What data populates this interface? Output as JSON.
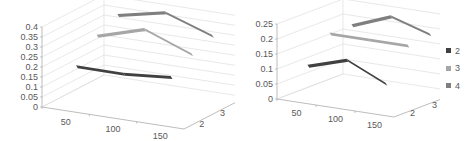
{
  "chart_data": [
    {
      "type": "line",
      "subtype": "3d-line",
      "title": "",
      "xlabel": "",
      "ylabel": "",
      "x": [
        50,
        100,
        150
      ],
      "x_tick_labels": [
        "50",
        "100",
        "150"
      ],
      "depth_tick_labels": [
        "2",
        "3",
        "4"
      ],
      "y_tick_labels": [
        "0",
        "0.05",
        "0.1",
        "0.15",
        "0.2",
        "0.25",
        "0.3",
        "0.35",
        "0.4"
      ],
      "ylim": [
        0,
        0.4
      ],
      "grid": true,
      "series": [
        {
          "name": "2",
          "color": "#404040",
          "values": [
            0.2,
            0.2,
            0.22
          ]
        },
        {
          "name": "3",
          "color": "#a6a6a6",
          "values": [
            0.3,
            0.37,
            0.28
          ]
        },
        {
          "name": "4",
          "color": "#7f7f7f",
          "values": [
            0.35,
            0.4,
            0.32
          ]
        }
      ]
    },
    {
      "type": "line",
      "subtype": "3d-line",
      "title": "",
      "xlabel": "",
      "ylabel": "",
      "x": [
        50,
        100,
        150
      ],
      "x_tick_labels": [
        "50",
        "100",
        "150"
      ],
      "depth_tick_labels": [
        "2",
        "3",
        "4"
      ],
      "y_tick_labels": [
        "0",
        "0.05",
        "0.1",
        "0.15",
        "0.2",
        "0.25"
      ],
      "ylim": [
        0,
        0.25
      ],
      "grid": true,
      "legend_position": "right",
      "series": [
        {
          "name": "2",
          "color": "#404040",
          "values": [
            0.11,
            0.15,
            0.09
          ]
        },
        {
          "name": "3",
          "color": "#a6a6a6",
          "values": [
            0.19,
            0.19,
            0.19
          ]
        },
        {
          "name": "4",
          "color": "#7f7f7f",
          "values": [
            0.19,
            0.24,
            0.2
          ]
        }
      ]
    }
  ],
  "legend": {
    "items": [
      {
        "label": "2",
        "color": "#404040"
      },
      {
        "label": "3",
        "color": "#a6a6a6"
      },
      {
        "label": "4",
        "color": "#7f7f7f"
      }
    ]
  }
}
